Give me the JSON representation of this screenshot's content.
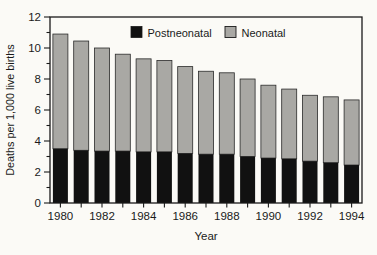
{
  "chart_data": {
    "type": "bar",
    "stacked": true,
    "title": "",
    "xlabel": "Year",
    "ylabel": "Deaths per 1,000 live births",
    "ylim": [
      0,
      12
    ],
    "ytick_interval": 1,
    "ytick_label_step": 2,
    "ytick_labels": [
      "0",
      "2",
      "4",
      "6",
      "8",
      "10",
      "12"
    ],
    "categories": [
      "1980",
      "1981",
      "1982",
      "1983",
      "1984",
      "1985",
      "1986",
      "1987",
      "1988",
      "1989",
      "1990",
      "1991",
      "1992",
      "1993",
      "1994"
    ],
    "xtick_labels_shown": [
      "1980",
      "1982",
      "1984",
      "1986",
      "1988",
      "1990",
      "1992",
      "1994"
    ],
    "series": [
      {
        "name": "Postneonatal",
        "color": "#111111",
        "values": [
          3.5,
          3.4,
          3.35,
          3.35,
          3.3,
          3.3,
          3.2,
          3.15,
          3.15,
          3.0,
          2.9,
          2.85,
          2.7,
          2.6,
          2.45
        ]
      },
      {
        "name": "Neonatal",
        "color": "#a9a8a4",
        "values": [
          7.4,
          7.05,
          6.65,
          6.25,
          6.0,
          5.9,
          5.6,
          5.35,
          5.25,
          5.0,
          4.7,
          4.5,
          4.25,
          4.25,
          4.2
        ]
      }
    ],
    "stacked_totals": [
      10.9,
      10.45,
      10.0,
      9.6,
      9.3,
      9.2,
      8.8,
      8.5,
      8.4,
      8.0,
      7.6,
      7.35,
      6.95,
      6.85,
      6.65
    ],
    "legend": {
      "position": "top-inside",
      "entries": [
        "Postneonatal",
        "Neonatal"
      ]
    },
    "grid": false,
    "bar_outline_color": "#2a2a2a",
    "frame_color": "#1a1a1a",
    "background_color": "#fbfaf6",
    "bar_width_px": 15
  }
}
